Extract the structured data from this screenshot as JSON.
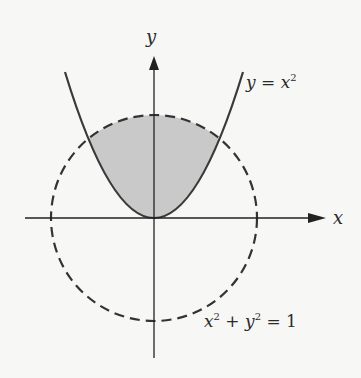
{
  "diagram": {
    "axes": {
      "x_label": "x",
      "y_label": "y"
    },
    "curves": [
      {
        "name": "parabola",
        "equation_lhs": "y = x",
        "equation_exp": "2",
        "style": "solid"
      },
      {
        "name": "unit-circle",
        "equation": "x² + y² = 1",
        "style": "dashed"
      }
    ],
    "shaded_region": "region inside circle and above parabola",
    "colors": {
      "curve": "#3a3a3a",
      "shade": "#c9c9c9",
      "background": "#f7f7f5"
    }
  },
  "labels": {
    "y_axis": "y",
    "x_axis": "x",
    "parabola_a": "y = x",
    "parabola_exp": "2",
    "circle_x": "x",
    "circle_exp1": "2",
    "circle_mid": " + y",
    "circle_exp2": "2",
    "circle_end": " = 1"
  }
}
